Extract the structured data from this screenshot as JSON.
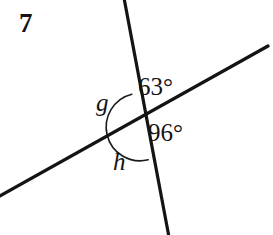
{
  "figure": {
    "problem_number": "7",
    "background_color": "#ffffff",
    "stroke_color": "#141414",
    "width": 273,
    "height": 235,
    "labels": {
      "angle_upper_right": "63°",
      "angle_lower_right": "96°",
      "variable_left": "g",
      "variable_bottom": "h"
    },
    "geometry": {
      "intersection": {
        "x": 138,
        "y": 127
      },
      "steep_line": {
        "name": "steep-transversal-line",
        "x1": 124,
        "y1": -2,
        "x2": 169,
        "y2": 237,
        "stroke_width": 3.2
      },
      "shallow_line": {
        "name": "shallow-transversal-line",
        "x1": -2,
        "y1": 197,
        "x2": 268,
        "y2": 46,
        "stroke_width": 3.2
      },
      "angle_arc": {
        "name": "angle-arc-g-h",
        "radius": 33,
        "start_x": 131.8,
        "start_y": 94.2,
        "end_x": 148.2,
        "end_y": 159.8,
        "stroke_width": 1.6,
        "sweep": "counterclockwise-through-left"
      }
    }
  }
}
